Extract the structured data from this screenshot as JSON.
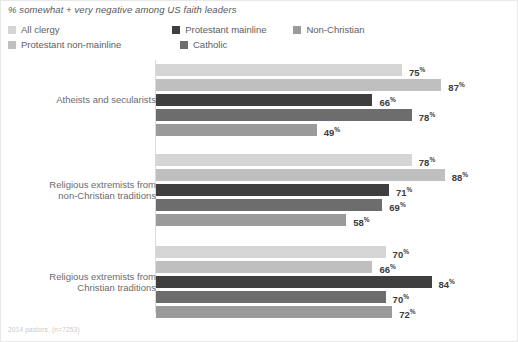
{
  "chart_data": {
    "type": "bar",
    "orientation": "horizontal",
    "title": "% somewhat + very negative among US faith leaders",
    "xlabel": "",
    "ylabel": "",
    "xlim": [
      0,
      100
    ],
    "grid": false,
    "legend_position": "top-left",
    "value_suffix": "%",
    "categories": [
      "Atheists and secularists",
      "Religious extremists from non-Christian traditions",
      "Religious extremists from Christian traditions"
    ],
    "series": [
      {
        "name": "All clergy",
        "color": "#d5d5d5",
        "values": [
          75,
          78,
          70
        ]
      },
      {
        "name": "Protestant non-mainline",
        "color": "#bfbfbf",
        "values": [
          87,
          88,
          66
        ]
      },
      {
        "name": "Protestant mainline",
        "color": "#3f3f3f",
        "values": [
          66,
          71,
          84
        ]
      },
      {
        "name": "Catholic",
        "color": "#6d6d6d",
        "values": [
          78,
          69,
          70
        ]
      },
      {
        "name": "Non-Christian",
        "color": "#9a9a9a",
        "values": [
          49,
          58,
          72
        ]
      }
    ],
    "footnote": "2014 pastors, (n=7253)"
  },
  "legend": {
    "rows": [
      [
        {
          "label": "All clergy",
          "color": "#d5d5d5"
        },
        {
          "label": "Protestant mainline",
          "color": "#3f3f3f"
        },
        {
          "label": "Non-Christian",
          "color": "#9a9a9a"
        }
      ],
      [
        {
          "label": "Protestant non-mainline",
          "color": "#bfbfbf"
        },
        {
          "label": "Catholic",
          "color": "#6d6d6d"
        }
      ]
    ]
  },
  "groups": [
    {
      "label_line1": "Atheists and secularists",
      "label_line2": "",
      "bars": [
        {
          "series": "All clergy",
          "value": "75",
          "suffix": "%",
          "color": "#d5d5d5"
        },
        {
          "series": "Protestant non-mainline",
          "value": "87",
          "suffix": "%",
          "color": "#bfbfbf"
        },
        {
          "series": "Protestant mainline",
          "value": "66",
          "suffix": "%",
          "color": "#3f3f3f"
        },
        {
          "series": "Catholic",
          "value": "78",
          "suffix": "%",
          "color": "#6d6d6d"
        },
        {
          "series": "Non-Christian",
          "value": "49",
          "suffix": "%",
          "color": "#9a9a9a"
        }
      ]
    },
    {
      "label_line1": "Religious extremists from",
      "label_line2": "non-Christian traditions",
      "bars": [
        {
          "series": "All clergy",
          "value": "78",
          "suffix": "%",
          "color": "#d5d5d5"
        },
        {
          "series": "Protestant non-mainline",
          "value": "88",
          "suffix": "%",
          "color": "#bfbfbf"
        },
        {
          "series": "Protestant mainline",
          "value": "71",
          "suffix": "%",
          "color": "#3f3f3f"
        },
        {
          "series": "Catholic",
          "value": "69",
          "suffix": "%",
          "color": "#6d6d6d"
        },
        {
          "series": "Non-Christian",
          "value": "58",
          "suffix": "%",
          "color": "#9a9a9a"
        }
      ]
    },
    {
      "label_line1": "Religious extremists from",
      "label_line2": "Christian traditions",
      "bars": [
        {
          "series": "All clergy",
          "value": "70",
          "suffix": "%",
          "color": "#d5d5d5"
        },
        {
          "series": "Protestant non-mainline",
          "value": "66",
          "suffix": "%",
          "color": "#bfbfbf"
        },
        {
          "series": "Protestant mainline",
          "value": "84",
          "suffix": "%",
          "color": "#3f3f3f"
        },
        {
          "series": "Catholic",
          "value": "70",
          "suffix": "%",
          "color": "#6d6d6d"
        },
        {
          "series": "Non-Christian",
          "value": "72",
          "suffix": "%",
          "color": "#9a9a9a"
        }
      ]
    }
  ],
  "footnote": "2014 pastors, (n=7253)"
}
